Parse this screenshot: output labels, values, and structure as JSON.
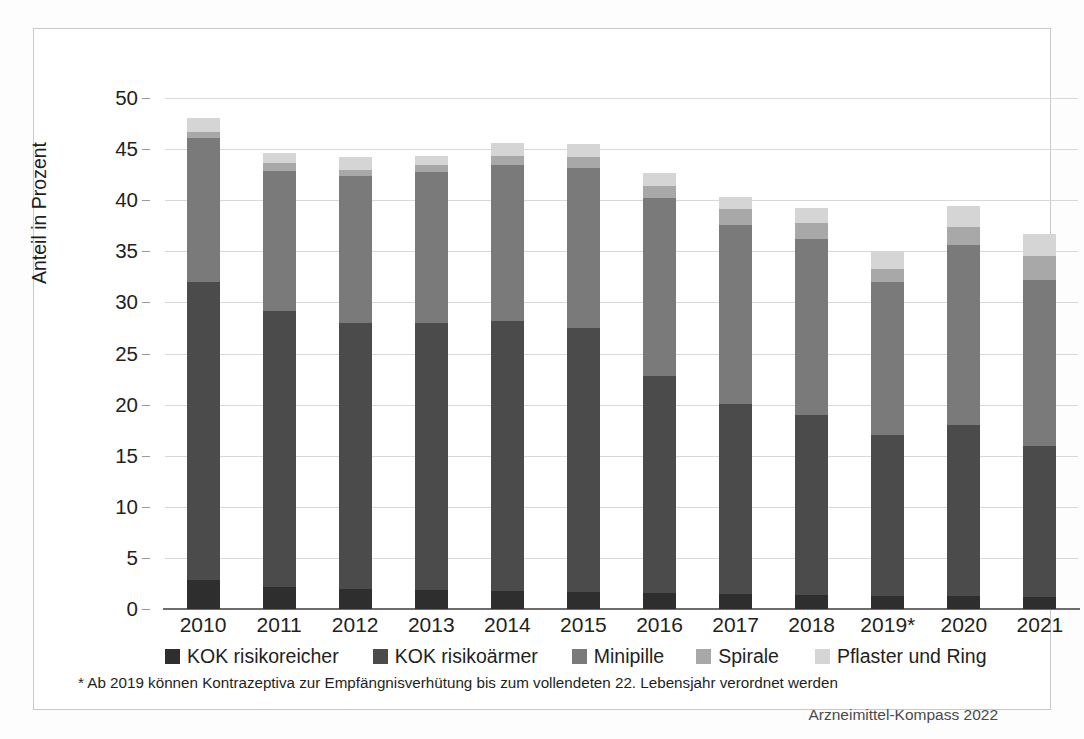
{
  "chart_data": {
    "type": "bar",
    "stacked": true,
    "title": "",
    "xlabel": "",
    "ylabel": "Anteil in Prozent",
    "ylim": [
      0,
      50
    ],
    "ytick_step": 5,
    "yticks": [
      "0",
      "5",
      "10",
      "15",
      "20",
      "25",
      "30",
      "35",
      "40",
      "45",
      "50"
    ],
    "grid": true,
    "legend_position": "bottom",
    "categories": [
      "2010",
      "2011",
      "2012",
      "2013",
      "2014",
      "2015",
      "2016",
      "2017",
      "2018",
      "2019*",
      "2020",
      "2021"
    ],
    "series": [
      {
        "name": "KOK risikoreicher",
        "color": "#2e2e2e",
        "values": [
          2.8,
          2.2,
          2.0,
          1.9,
          1.8,
          1.7,
          1.6,
          1.5,
          1.4,
          1.3,
          1.3,
          1.2
        ]
      },
      {
        "name": "KOK risikoärmer",
        "color": "#4b4b4b",
        "values": [
          29.2,
          27.0,
          26.0,
          26.1,
          26.4,
          25.8,
          21.2,
          18.6,
          17.6,
          15.7,
          16.7,
          14.8
        ]
      },
      {
        "name": "Minipille",
        "color": "#7a7a7a",
        "values": [
          14.1,
          13.7,
          14.4,
          14.8,
          15.2,
          15.7,
          17.4,
          17.5,
          17.2,
          15.0,
          17.6,
          16.2
        ]
      },
      {
        "name": "Spirale",
        "color": "#a8a8a8",
        "values": [
          0.6,
          0.7,
          0.6,
          0.6,
          0.9,
          1.0,
          1.2,
          1.5,
          1.6,
          1.3,
          1.8,
          2.3
        ]
      },
      {
        "name": "Pflaster und Ring",
        "color": "#d5d5d5",
        "values": [
          1.3,
          1.0,
          1.2,
          0.9,
          1.3,
          1.3,
          1.3,
          1.2,
          1.4,
          1.7,
          2.0,
          2.2
        ]
      }
    ],
    "totals": [
      48.0,
      44.6,
      44.2,
      44.3,
      45.6,
      45.5,
      42.7,
      40.3,
      39.2,
      35.0,
      39.4,
      36.7
    ],
    "annotations": {
      "footnote": "* Ab 2019 können Kontrazeptiva zur Empfängnisverhütung bis zum vollendeten 22. Lebensjahr verordnet werden",
      "source": "Arzneimittel-Kompass 2022"
    }
  }
}
